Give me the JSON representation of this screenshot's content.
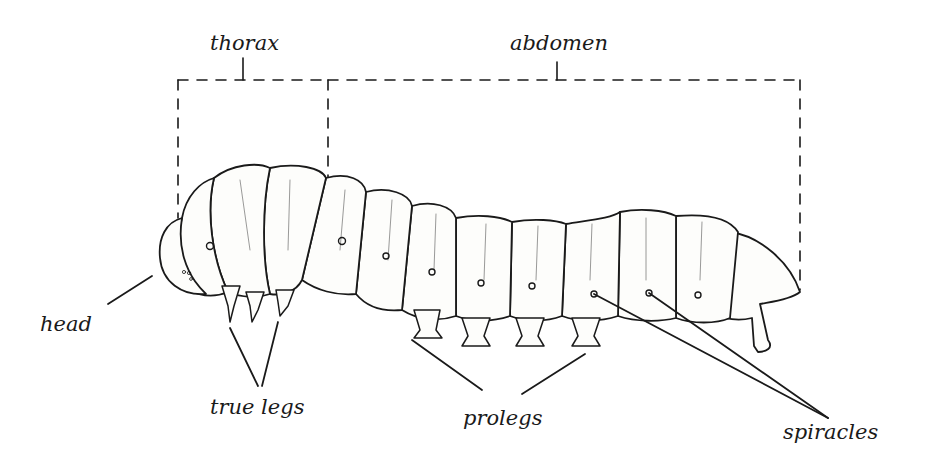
{
  "diagram": {
    "title": "",
    "labels": {
      "thorax": "thorax",
      "abdomen": "abdomen",
      "head": "head",
      "true_legs": "true legs",
      "prolegs": "prolegs",
      "spiracles": "spiracles"
    },
    "colors": {
      "ink": "#1a1a1a",
      "background": "#ffffff",
      "body_fill": "#fdfdfb"
    }
  }
}
